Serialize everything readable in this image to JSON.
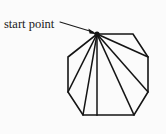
{
  "figure": {
    "kind": "geometry-diagram",
    "background_color": "#fbfbfb",
    "ink_color": "#141414"
  },
  "annotation": {
    "label": "start point",
    "label_position": {
      "x": 4,
      "y": 28
    },
    "leader_line": {
      "x1": 60,
      "y1": 22,
      "x2": 93,
      "y2": 32
    },
    "arrow_tip": {
      "x": 97,
      "y": 34
    }
  },
  "chart_data": {
    "type": "diagram",
    "title": "start point",
    "shape": "octagon",
    "vertex_count": 8,
    "start_vertex_index": 0,
    "diagonal_count": 5,
    "vertices": [
      {
        "index": 0,
        "name": "start-point",
        "x": 97,
        "y": 34
      },
      {
        "index": 1,
        "name": "top-right",
        "x": 133,
        "y": 34
      },
      {
        "index": 2,
        "name": "right-upper",
        "x": 148,
        "y": 57
      },
      {
        "index": 3,
        "name": "right-lower",
        "x": 148,
        "y": 92
      },
      {
        "index": 4,
        "name": "bottom-right",
        "x": 134,
        "y": 115
      },
      {
        "index": 5,
        "name": "bottom-left",
        "x": 83,
        "y": 115
      },
      {
        "index": 6,
        "name": "left-lower",
        "x": 68,
        "y": 92
      },
      {
        "index": 7,
        "name": "left-upper",
        "x": 68,
        "y": 57
      }
    ],
    "outline_path": "M 97 34 L 133 34 L 148 57 L 148 92 L 134 115 L 83 115 L 68 92 L 68 57 Z",
    "diagonals": [
      {
        "from": 0,
        "to": 2,
        "x1": 97,
        "y1": 34,
        "x2": 148,
        "y2": 57
      },
      {
        "from": 0,
        "to": 3,
        "x1": 97,
        "y1": 34,
        "x2": 148,
        "y2": 92
      },
      {
        "from": 0,
        "to": 4,
        "x1": 97,
        "y1": 34,
        "x2": 134,
        "y2": 115
      },
      {
        "from": 0,
        "to": 5,
        "x1": 97,
        "y1": 34,
        "x2": 83,
        "y2": 115
      },
      {
        "from": 0,
        "to": 6,
        "x1": 97,
        "y1": 34,
        "x2": 68,
        "y2": 92
      }
    ],
    "extra_segments": [
      {
        "name": "median-to-bottom-edge",
        "x1": 97,
        "y1": 34,
        "x2": 97,
        "y2": 115
      }
    ]
  }
}
